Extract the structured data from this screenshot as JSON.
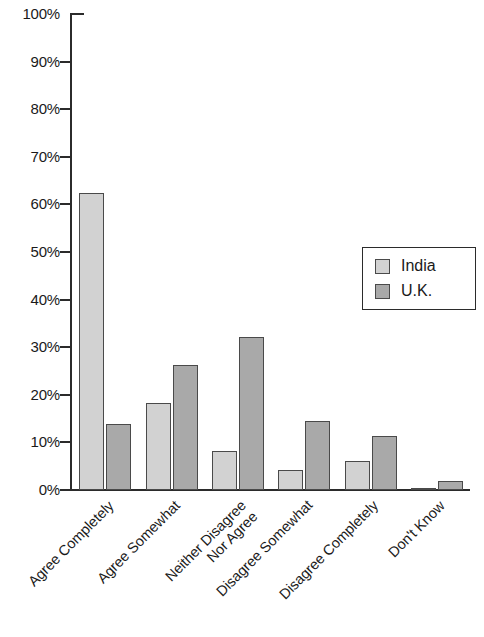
{
  "chart_data": {
    "type": "bar",
    "title": "",
    "xlabel": "",
    "ylabel": "",
    "ylim": [
      0,
      100
    ],
    "grid": false,
    "legend_position": "right-middle",
    "y_ticks": [
      "0%",
      "10%",
      "20%",
      "30%",
      "40%",
      "50%",
      "60%",
      "70%",
      "80%",
      "90%",
      "100%"
    ],
    "y_tick_values": [
      0,
      10,
      20,
      30,
      40,
      50,
      60,
      70,
      80,
      90,
      100
    ],
    "categories": [
      "Agree Completely",
      "Agree Somewhat",
      "Neither Disagree Nor Agree",
      "Disagree Somewhat",
      "Disagree Completely",
      "Don't Know"
    ],
    "category_lines": [
      [
        "Agree Completely"
      ],
      [
        "Agree Somewhat"
      ],
      [
        "Neither Disagree",
        "Nor Agree"
      ],
      [
        "Disagree Somewhat"
      ],
      [
        "Disagree Completely"
      ],
      [
        "Don't Know"
      ]
    ],
    "series": [
      {
        "name": "India",
        "color": "#d2d2d2",
        "values": [
          62.5,
          18.3,
          8.1,
          4.3,
          6.2,
          0.5
        ]
      },
      {
        "name": "U.K.",
        "color": "#a9a9a9",
        "values": [
          13.9,
          26.2,
          32.2,
          14.6,
          11.3,
          1.8
        ]
      }
    ]
  },
  "legend": {
    "items": [
      {
        "label": "India",
        "swatch": "india"
      },
      {
        "label": "U.K.",
        "swatch": "uk"
      }
    ]
  }
}
